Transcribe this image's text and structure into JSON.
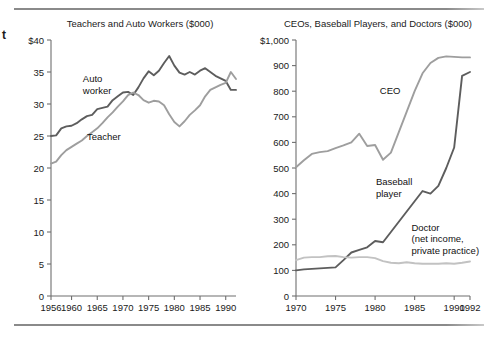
{
  "figure": {
    "margin_mark": "t",
    "rules": {
      "top_label": "top-rule",
      "bottom_label": "bottom-rule"
    }
  },
  "chart_data": [
    {
      "id": "teachers-auto-workers",
      "type": "line",
      "title": "Teachers and Auto Workers ($000)",
      "xlabel": "",
      "ylabel": "",
      "xlim": [
        1956,
        1992
      ],
      "ylim": [
        0,
        40
      ],
      "grid": false,
      "legend": "inline-annotations",
      "ytick_labels": [
        "$40",
        "35",
        "30",
        "25",
        "20",
        "15",
        "10",
        "5",
        "0"
      ],
      "ytick_values": [
        40,
        35,
        30,
        25,
        20,
        15,
        10,
        5,
        0
      ],
      "xtick_labels": [
        "1956",
        "1960",
        "1965",
        "1970",
        "1975",
        "1980",
        "1985",
        "1990"
      ],
      "xtick_values": [
        1956,
        1960,
        1965,
        1970,
        1975,
        1980,
        1985,
        1990
      ],
      "series": [
        {
          "name": "Auto worker",
          "color": "#5d5d5d",
          "label_x": 1962.2,
          "label_y": 33.4,
          "x": [
            1956,
            1957,
            1958,
            1959,
            1960,
            1961,
            1962,
            1963,
            1964,
            1965,
            1966,
            1967,
            1968,
            1969,
            1970,
            1971,
            1972,
            1973,
            1974,
            1975,
            1976,
            1977,
            1978,
            1979,
            1980,
            1981,
            1982,
            1983,
            1984,
            1985,
            1986,
            1987,
            1988,
            1989,
            1990,
            1991,
            1992
          ],
          "values": [
            25.0,
            25.1,
            26.2,
            26.5,
            26.6,
            27.0,
            27.6,
            28.1,
            28.3,
            29.2,
            29.4,
            29.6,
            30.6,
            31.2,
            31.8,
            31.9,
            31.4,
            32.6,
            34.0,
            35.1,
            34.5,
            35.2,
            36.4,
            37.5,
            36.0,
            34.9,
            34.6,
            35.0,
            34.6,
            35.2,
            35.6,
            35.0,
            34.4,
            34.0,
            33.6,
            32.2,
            32.2
          ]
        },
        {
          "name": "Teacher",
          "color": "#9e9e9e",
          "label_x": 1963.0,
          "label_y": 24.4,
          "x": [
            1956,
            1957,
            1958,
            1959,
            1960,
            1961,
            1962,
            1963,
            1964,
            1965,
            1966,
            1967,
            1968,
            1969,
            1970,
            1971,
            1972,
            1973,
            1974,
            1975,
            1976,
            1977,
            1978,
            1979,
            1980,
            1981,
            1982,
            1983,
            1984,
            1985,
            1986,
            1987,
            1988,
            1989,
            1990,
            1991,
            1992
          ],
          "values": [
            20.7,
            21.0,
            22.0,
            22.8,
            23.3,
            23.8,
            24.3,
            25.0,
            25.6,
            26.2,
            27.0,
            27.9,
            28.7,
            29.6,
            30.4,
            31.4,
            31.8,
            31.4,
            30.6,
            30.2,
            30.5,
            30.4,
            29.8,
            28.4,
            27.2,
            26.5,
            27.3,
            28.3,
            29.0,
            29.8,
            31.2,
            32.2,
            32.6,
            33.0,
            33.3,
            35.0,
            33.9
          ]
        }
      ]
    },
    {
      "id": "ceos-baseball-doctors",
      "type": "line",
      "title": "CEOs, Baseball Players, and Doctors ($000)",
      "xlabel": "",
      "ylabel": "",
      "xlim": [
        1970,
        1992
      ],
      "ylim": [
        0,
        1000
      ],
      "grid": false,
      "legend": "inline-annotations",
      "ytick_labels": [
        "$1,000",
        "900",
        "800",
        "700",
        "600",
        "500",
        "400",
        "300",
        "200",
        "100",
        "0"
      ],
      "ytick_values": [
        1000,
        900,
        800,
        700,
        600,
        500,
        400,
        300,
        200,
        100,
        0
      ],
      "xtick_labels": [
        "1970",
        "1975",
        "1980",
        "1985",
        "1990",
        "1992"
      ],
      "xtick_values": [
        1970,
        1975,
        1980,
        1985,
        1990,
        1992
      ],
      "series": [
        {
          "name": "CEO",
          "color": "#9e9e9e",
          "label_x": 1980.6,
          "label_y": 790,
          "x": [
            1970,
            1971,
            1972,
            1973,
            1974,
            1975,
            1976,
            1977,
            1978,
            1979,
            1980,
            1981,
            1982,
            1983,
            1984,
            1985,
            1986,
            1987,
            1988,
            1989,
            1990,
            1991,
            1992
          ],
          "values": [
            503,
            530,
            555,
            562,
            566,
            578,
            588,
            600,
            634,
            586,
            590,
            532,
            560,
            640,
            720,
            800,
            870,
            910,
            930,
            936,
            934,
            932,
            932
          ]
        },
        {
          "name": "Baseball player",
          "color": "#5d5d5d",
          "label_x": 1980.1,
          "label_y": 432,
          "x": [
            1970,
            1971,
            1972,
            1973,
            1974,
            1975,
            1976,
            1977,
            1978,
            1979,
            1980,
            1981,
            1982,
            1983,
            1984,
            1985,
            1986,
            1987,
            1988,
            1989,
            1990,
            1991,
            1992
          ],
          "values": [
            100,
            104,
            106,
            108,
            110,
            112,
            140,
            170,
            180,
            190,
            215,
            210,
            250,
            290,
            330,
            370,
            410,
            400,
            430,
            500,
            580,
            860,
            875
          ]
        },
        {
          "name": "Doctor (net income, private practice)",
          "label_lines": [
            "Doctor",
            "(net income,",
            "private practice)"
          ],
          "color": "#c2c2c2",
          "label_x": 1984.6,
          "label_y": 255,
          "x": [
            1970,
            1971,
            1972,
            1973,
            1974,
            1975,
            1976,
            1977,
            1978,
            1979,
            1980,
            1981,
            1982,
            1983,
            1984,
            1985,
            1986,
            1987,
            1988,
            1989,
            1990,
            1991,
            1992
          ],
          "values": [
            140,
            150,
            152,
            152,
            155,
            156,
            152,
            150,
            152,
            152,
            148,
            136,
            130,
            128,
            132,
            128,
            126,
            126,
            126,
            128,
            126,
            130,
            135
          ]
        }
      ]
    }
  ]
}
